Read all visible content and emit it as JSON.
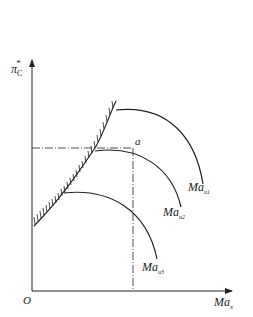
{
  "diagram": {
    "type": "compressor characteristic map",
    "y_axis": {
      "label": "π",
      "subscript": "C",
      "superscript": "*"
    },
    "x_axis": {
      "label": "Ma",
      "subscript": "x"
    },
    "origin_label": "O",
    "point_label": "a",
    "curves": [
      {
        "label": "Ma",
        "subscript": "u1"
      },
      {
        "label": "Ma",
        "subscript": "u2"
      },
      {
        "label": "Ma",
        "subscript": "u3"
      }
    ],
    "colors": {
      "line": "#222222",
      "background": "#ffffff"
    }
  }
}
